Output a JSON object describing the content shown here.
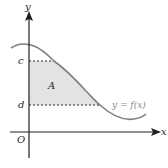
{
  "diagram": {
    "labels": {
      "y_axis": "y",
      "x_axis": "x",
      "origin": "O",
      "c": "c",
      "d": "d",
      "region": "A",
      "curve": "y = f(x)"
    },
    "colors": {
      "axis": "#231f20",
      "curve": "#7f7f7f",
      "shade": "#e3e3e3",
      "dash": "#231f20",
      "curve_label": "#8a8a8a"
    }
  }
}
